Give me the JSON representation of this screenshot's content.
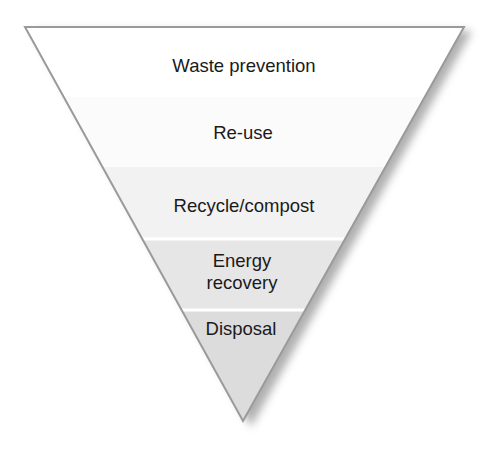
{
  "diagram": {
    "type": "inverted-pyramid",
    "orientation": "most preferred at top, least preferred at bottom",
    "outline_color": "#9a9a9a",
    "shadow_color": "#7a7a7a",
    "separator_color": "#ffffff",
    "tiers": [
      {
        "id": "waste-prevention",
        "label": "Waste prevention",
        "lines": [
          "Waste prevention"
        ],
        "fill": "#ffffff"
      },
      {
        "id": "re-use",
        "label": "Re-use",
        "lines": [
          "Re-use"
        ],
        "fill": "#fbfbfb"
      },
      {
        "id": "recycle-compost",
        "label": "Recycle/compost",
        "lines": [
          "Recycle/compost"
        ],
        "fill": "#f2f2f2"
      },
      {
        "id": "energy-recovery",
        "label": "Energy recovery",
        "lines": [
          "Energy",
          "recovery"
        ],
        "fill": "#e6e6e6"
      },
      {
        "id": "disposal",
        "label": "Disposal",
        "lines": [
          "Disposal"
        ],
        "fill": "#dcdcdc"
      }
    ]
  }
}
